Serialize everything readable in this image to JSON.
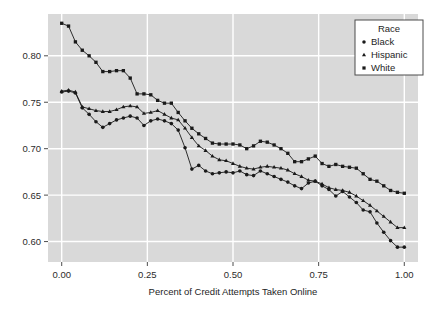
{
  "chart_data": {
    "type": "line",
    "title": "",
    "subtitle": "",
    "xlabel": "Percent of Credit Attempts Taken Online",
    "ylabel": "",
    "xlim": [
      -0.04,
      1.04
    ],
    "ylim": [
      0.578,
      0.845
    ],
    "xticks": [
      0.0,
      0.25,
      0.5,
      0.75,
      1.0
    ],
    "xtick_labels": [
      "0.00",
      "0.25",
      "0.50",
      "0.75",
      "1.00"
    ],
    "yticks": [
      0.6,
      0.65,
      0.7,
      0.75,
      0.8
    ],
    "ytick_labels": [
      "0.60",
      "0.65",
      "0.70",
      "0.75",
      "0.80"
    ],
    "grid": true,
    "grid_color": "#ffffff",
    "panel_background": "#d9d9d9",
    "figure_background": "#ffffff",
    "legend": {
      "title": "Race",
      "position": "top-right-inside",
      "entries": [
        {
          "label": "Black",
          "marker": "circle",
          "color": "#1a1a1a"
        },
        {
          "label": "Hispanic",
          "marker": "triangle",
          "color": "#1a1a1a"
        },
        {
          "label": "White",
          "marker": "square",
          "color": "#1a1a1a"
        }
      ]
    },
    "series": [
      {
        "name": "White",
        "marker": "square",
        "color": "#1a1a1a",
        "x": [
          0.0,
          0.02,
          0.04,
          0.06,
          0.08,
          0.1,
          0.12,
          0.14,
          0.16,
          0.18,
          0.2,
          0.22,
          0.24,
          0.26,
          0.28,
          0.3,
          0.32,
          0.34,
          0.36,
          0.38,
          0.4,
          0.42,
          0.44,
          0.46,
          0.48,
          0.5,
          0.52,
          0.54,
          0.56,
          0.58,
          0.6,
          0.62,
          0.64,
          0.66,
          0.68,
          0.7,
          0.72,
          0.74,
          0.76,
          0.78,
          0.8,
          0.82,
          0.84,
          0.86,
          0.88,
          0.9,
          0.92,
          0.94,
          0.96,
          0.98,
          1.0
        ],
        "y": [
          0.835,
          0.832,
          0.815,
          0.806,
          0.8,
          0.793,
          0.783,
          0.783,
          0.784,
          0.784,
          0.776,
          0.759,
          0.759,
          0.758,
          0.752,
          0.749,
          0.749,
          0.739,
          0.73,
          0.722,
          0.716,
          0.711,
          0.706,
          0.705,
          0.705,
          0.705,
          0.704,
          0.7,
          0.703,
          0.708,
          0.707,
          0.704,
          0.7,
          0.695,
          0.686,
          0.686,
          0.689,
          0.692,
          0.684,
          0.681,
          0.683,
          0.681,
          0.68,
          0.679,
          0.673,
          0.667,
          0.665,
          0.66,
          0.655,
          0.653,
          0.652
        ]
      },
      {
        "name": "Hispanic",
        "marker": "triangle",
        "color": "#1a1a1a",
        "x": [
          0.0,
          0.02,
          0.04,
          0.06,
          0.08,
          0.1,
          0.12,
          0.14,
          0.16,
          0.18,
          0.2,
          0.22,
          0.24,
          0.26,
          0.28,
          0.3,
          0.32,
          0.34,
          0.36,
          0.38,
          0.4,
          0.42,
          0.44,
          0.46,
          0.48,
          0.5,
          0.52,
          0.54,
          0.56,
          0.58,
          0.6,
          0.62,
          0.64,
          0.66,
          0.68,
          0.7,
          0.72,
          0.74,
          0.76,
          0.78,
          0.8,
          0.82,
          0.84,
          0.86,
          0.88,
          0.9,
          0.92,
          0.94,
          0.96,
          0.98,
          1.0
        ],
        "y": [
          0.762,
          0.763,
          0.761,
          0.745,
          0.743,
          0.741,
          0.74,
          0.74,
          0.742,
          0.745,
          0.746,
          0.745,
          0.738,
          0.739,
          0.741,
          0.737,
          0.733,
          0.731,
          0.722,
          0.712,
          0.703,
          0.698,
          0.692,
          0.688,
          0.687,
          0.684,
          0.681,
          0.679,
          0.678,
          0.68,
          0.681,
          0.68,
          0.679,
          0.677,
          0.673,
          0.67,
          0.666,
          0.665,
          0.662,
          0.658,
          0.656,
          0.655,
          0.653,
          0.649,
          0.644,
          0.639,
          0.633,
          0.627,
          0.621,
          0.615,
          0.615
        ]
      },
      {
        "name": "Black",
        "marker": "circle",
        "color": "#1a1a1a",
        "x": [
          0.0,
          0.02,
          0.04,
          0.06,
          0.08,
          0.1,
          0.12,
          0.14,
          0.16,
          0.18,
          0.2,
          0.22,
          0.24,
          0.26,
          0.28,
          0.3,
          0.32,
          0.34,
          0.36,
          0.38,
          0.4,
          0.42,
          0.44,
          0.46,
          0.48,
          0.5,
          0.52,
          0.54,
          0.56,
          0.58,
          0.6,
          0.62,
          0.64,
          0.66,
          0.68,
          0.7,
          0.72,
          0.74,
          0.76,
          0.78,
          0.8,
          0.82,
          0.84,
          0.86,
          0.88,
          0.9,
          0.92,
          0.94,
          0.96,
          0.98,
          1.0
        ],
        "y": [
          0.761,
          0.762,
          0.76,
          0.744,
          0.737,
          0.729,
          0.723,
          0.727,
          0.731,
          0.733,
          0.735,
          0.733,
          0.725,
          0.73,
          0.732,
          0.73,
          0.727,
          0.72,
          0.701,
          0.678,
          0.682,
          0.676,
          0.673,
          0.674,
          0.675,
          0.674,
          0.676,
          0.672,
          0.671,
          0.676,
          0.673,
          0.67,
          0.667,
          0.664,
          0.66,
          0.657,
          0.663,
          0.665,
          0.66,
          0.656,
          0.649,
          0.654,
          0.648,
          0.642,
          0.634,
          0.632,
          0.62,
          0.61,
          0.601,
          0.594,
          0.594
        ]
      }
    ]
  }
}
